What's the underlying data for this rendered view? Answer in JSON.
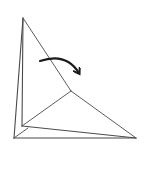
{
  "diagram": {
    "type": "origami-fold-step",
    "colors": {
      "background": "#ffffff",
      "line": "#4a4a4a",
      "arrow": "#1a1a1a"
    },
    "elements": [
      {
        "name": "outer-left-edge",
        "kind": "paper-edge"
      },
      {
        "name": "inner-left-edge",
        "kind": "paper-edge"
      },
      {
        "name": "upper-diagonal-edge",
        "kind": "paper-edge"
      },
      {
        "name": "lower-diagonal-edge",
        "kind": "paper-edge"
      },
      {
        "name": "inner-crease",
        "kind": "fold-line"
      },
      {
        "name": "flap-bottom-edge",
        "kind": "paper-edge"
      },
      {
        "name": "bottom-edge",
        "kind": "paper-edge"
      },
      {
        "name": "corner-crease",
        "kind": "fold-line"
      },
      {
        "name": "fold-arrow",
        "kind": "arrow",
        "direction": "clockwise-down-right"
      }
    ]
  }
}
